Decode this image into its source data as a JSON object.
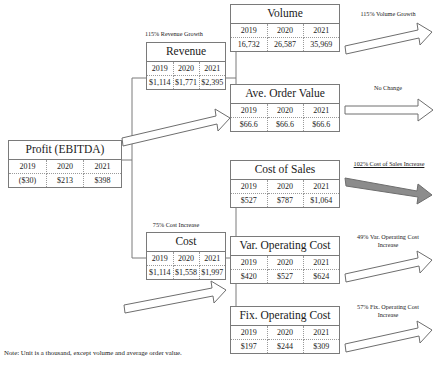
{
  "diagram": {
    "title_note": "Note: Unit is a thousand, except volume and average order value.",
    "year_headers": [
      "2019",
      "2020",
      "2021"
    ],
    "nodes": {
      "profit": {
        "title": "Profit (EBITDA)",
        "values": [
          "($30)",
          "$213",
          "$398"
        ]
      },
      "revenue": {
        "title": "Revenue",
        "values": [
          "$1,114",
          "$1,771",
          "$2,395"
        ]
      },
      "cost": {
        "title": "Cost",
        "values": [
          "$1,114",
          "$1,558",
          "$1,997"
        ]
      },
      "volume": {
        "title": "Volume",
        "values": [
          "16,732",
          "26,587",
          "35,969"
        ]
      },
      "aov": {
        "title": "Ave. Order Value",
        "values": [
          "$66.6",
          "$66.6",
          "$66.6"
        ]
      },
      "cos": {
        "title": "Cost of Sales",
        "values": [
          "$527",
          "$787",
          "$1,064"
        ]
      },
      "varcost": {
        "title": "Var. Operating Cost",
        "values": [
          "$420",
          "$527",
          "$624"
        ]
      },
      "fixcost": {
        "title": "Fix. Operating Cost",
        "values": [
          "$197",
          "$244",
          "$309"
        ]
      }
    },
    "captions": {
      "revenue_growth": "115% Revenue Growth",
      "cost_increase": "75% Cost Increase",
      "volume_growth": "115% Volume Growth",
      "aov_change": "No Change",
      "cos_increase": "102% Cost of Sales Increase",
      "varcost_increase_l1": "49% Var. Operating Cost",
      "varcost_increase_l2": "Increase",
      "fixcost_increase_l1": "57% Fix. Operating Cost",
      "fixcost_increase_l2": "Increase"
    },
    "colors": {
      "border": "#7a7a7a",
      "arrow_outline": "#6e6e6e",
      "arrow_filled": "#8c8c8c",
      "text": "#1a1a1a"
    }
  }
}
